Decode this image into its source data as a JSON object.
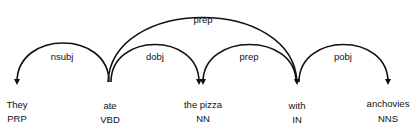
{
  "tokens": [
    {
      "word": "They",
      "tag": "PRP"
    },
    {
      "word": "ate",
      "tag": "VBD"
    },
    {
      "word": "the pizza",
      "tag": "NN"
    },
    {
      "word": "with",
      "tag": "IN"
    },
    {
      "word": "anchovies",
      "tag": "NNS"
    }
  ],
  "arcs": [
    {
      "label": "nsubj",
      "head": "ate",
      "dependent": "They"
    },
    {
      "label": "dobj",
      "head": "ate",
      "dependent": "the pizza"
    },
    {
      "label": "prep",
      "head": "ate",
      "dependent": "with"
    },
    {
      "label": "prep",
      "head": "the pizza",
      "dependent": "with"
    },
    {
      "label": "pobj",
      "head": "with",
      "dependent": "anchovies"
    }
  ]
}
